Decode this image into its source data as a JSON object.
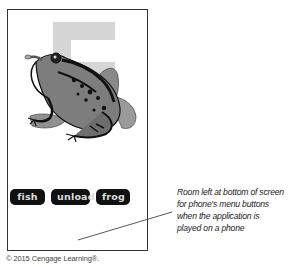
{
  "phone_screen": {
    "background_digit": "5",
    "digit_color": "#d4d4d4",
    "illustration": "frog",
    "buttons": [
      {
        "label": "fish"
      },
      {
        "label": "unload"
      },
      {
        "label": "frog"
      }
    ],
    "button_bg_color": "#111111",
    "button_text_color": "#dddddd"
  },
  "annotation": {
    "lines": [
      "Room left at bottom of screen",
      "for phone's menu buttons",
      "when the application is",
      "played on a phone"
    ]
  },
  "footer": {
    "copyright": "© 2015 Cengage Learning®."
  }
}
